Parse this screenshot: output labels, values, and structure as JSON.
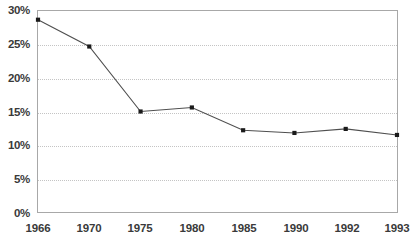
{
  "chart_data": {
    "type": "line",
    "title": "",
    "subtitle": "",
    "xlabel": "",
    "ylabel": "",
    "categories": [
      "1966",
      "1970",
      "1975",
      "1980",
      "1985",
      "1990",
      "1992",
      "1993"
    ],
    "values": [
      28.7,
      24.7,
      15.0,
      15.6,
      12.2,
      11.8,
      12.4,
      11.5
    ],
    "series": [
      {
        "name": "",
        "values": [
          28.7,
          24.7,
          15.0,
          15.6,
          12.2,
          11.8,
          12.4,
          11.5
        ]
      }
    ],
    "ylim": [
      0,
      30
    ],
    "ytick_values": [
      0,
      5,
      10,
      15,
      20,
      25,
      30
    ],
    "ytick_labels": [
      "0%",
      "5%",
      "10%",
      "15%",
      "20%",
      "25%",
      "30%"
    ],
    "xtick_labels": [
      "1966",
      "1970",
      "1975",
      "1980",
      "1985",
      "1990",
      "1992",
      "1993"
    ],
    "grid": true,
    "grid_axis": "y",
    "grid_style": "dotted",
    "legend": false,
    "legend_position": "none",
    "markers": true,
    "marker_shape": "square",
    "annotations": [],
    "colors": {
      "line": "#4f4f4f",
      "marker": "#1a1a1a",
      "grid": "#c4c4c4",
      "frame": "#a8a8a8",
      "label": "#3a3a3a",
      "background": "#ffffff"
    }
  }
}
